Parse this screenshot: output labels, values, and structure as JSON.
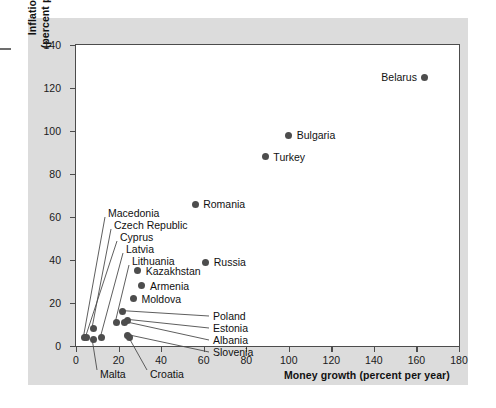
{
  "chart_data": {
    "type": "scatter",
    "title": "",
    "xlabel": "Money growth (percent per year)",
    "ylabel_line1": "Inflation rate",
    "ylabel_line2": "(percent per year)",
    "xlim": [
      0,
      180
    ],
    "ylim": [
      0,
      140
    ],
    "xticks": [
      0,
      20,
      40,
      60,
      80,
      100,
      120,
      140,
      160,
      180
    ],
    "yticks": [
      0,
      20,
      40,
      60,
      80,
      100,
      120,
      140
    ],
    "grid": false,
    "legend": "none",
    "marker_color": "#4d4d4d",
    "points": [
      {
        "name": "Belarus",
        "x": 164,
        "y": 125,
        "label_side": "left"
      },
      {
        "name": "Bulgaria",
        "x": 100,
        "y": 98,
        "label_side": "right"
      },
      {
        "name": "Turkey",
        "x": 89,
        "y": 88,
        "label_side": "right"
      },
      {
        "name": "Romania",
        "x": 56,
        "y": 66,
        "label_side": "right"
      },
      {
        "name": "Russia",
        "x": 61,
        "y": 39,
        "label_side": "right"
      },
      {
        "name": "Kazakhstan",
        "x": 29,
        "y": 35,
        "label_side": "right"
      },
      {
        "name": "Armenia",
        "x": 31,
        "y": 28,
        "label_side": "right"
      },
      {
        "name": "Moldova",
        "x": 27,
        "y": 22,
        "label_side": "right"
      },
      {
        "name": "Macedonia",
        "x": 4,
        "y": 4,
        "label_side": "leader"
      },
      {
        "name": "Czech Republic",
        "x": 8,
        "y": 8,
        "label_side": "leader"
      },
      {
        "name": "Cyprus",
        "x": 5,
        "y": 4,
        "label_side": "leader"
      },
      {
        "name": "Latvia",
        "x": 12,
        "y": 4,
        "label_side": "leader"
      },
      {
        "name": "Lithuania",
        "x": 19,
        "y": 11,
        "label_side": "leader"
      },
      {
        "name": "Poland",
        "x": 22,
        "y": 16,
        "label_side": "leader"
      },
      {
        "name": "Estonia",
        "x": 24,
        "y": 12,
        "label_side": "leader"
      },
      {
        "name": "Albania",
        "x": 23,
        "y": 11,
        "label_side": "leader"
      },
      {
        "name": "Slovenia",
        "x": 24,
        "y": 5,
        "label_side": "leader"
      },
      {
        "name": "Malta",
        "x": 8,
        "y": 3,
        "label_side": "leader-below"
      },
      {
        "name": "Croatia",
        "x": 25,
        "y": 4,
        "label_side": "leader-below"
      }
    ]
  },
  "figure": {
    "background": "#dcdcdc",
    "plot_background": "#ffffff",
    "axis_color": "#4c4c4c"
  }
}
